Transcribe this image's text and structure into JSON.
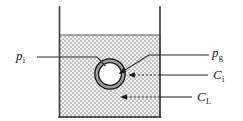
{
  "figure": {
    "background": "#ffffff",
    "width": 243,
    "height": 121
  },
  "vessel": {
    "name": "liquid-vessel",
    "wall_color": "#3a3a3a",
    "left_x": 59,
    "right_x": 160,
    "top_y": 7,
    "bottom_y": 117,
    "liquid_surface_y": 35,
    "liquid_fill_color": "#d9d9d9",
    "liquid_pattern": "fine-checker-hatch"
  },
  "bubble": {
    "name": "gas-bubble",
    "center_x": 110,
    "center_y": 74,
    "gas_core_radius": 12,
    "film_outer_radius": 16,
    "gas_core_color": "#ffffff",
    "film_color": "#9e9e9e",
    "outline_color": "#1a1a1a"
  },
  "labels": {
    "p_interface": {
      "name": "label-p-i",
      "symbol": "p",
      "subscript": "i",
      "meaning": "interface pressure",
      "x": 16,
      "y": 49
    },
    "p_gas": {
      "name": "label-p-g",
      "symbol": "p",
      "subscript": "g",
      "meaning": "gas phase pressure",
      "x": 212,
      "y": 46
    },
    "c_interface": {
      "name": "label-c-i",
      "symbol": "C",
      "subscript": "i",
      "meaning": "interface concentration",
      "x": 213,
      "y": 68
    },
    "c_liquid": {
      "name": "label-c-l",
      "symbol": "C",
      "subscript": "L",
      "meaning": "bulk liquid concentration",
      "x": 197,
      "y": 90
    }
  },
  "leaders": {
    "line_color": "#2b2b2b",
    "p_interface_leader": {
      "name": "leader-p-i",
      "style": "solid-elbow",
      "points": "37,57 97,57 106,66",
      "arrowhead": false
    },
    "p_gas_leader": {
      "name": "leader-p-g",
      "style": "solid-elbow-arrow",
      "points": "209,55 149,55 120,74",
      "arrowhead": true
    },
    "c_interface_leader": {
      "name": "leader-c-i",
      "style": "dashed-arrow",
      "points": "208,75 128,75",
      "arrowhead": true
    },
    "c_liquid_leader": {
      "name": "leader-c-l",
      "style": "dashed-arrow",
      "points": "192,97 120,97",
      "arrowhead": true
    }
  }
}
